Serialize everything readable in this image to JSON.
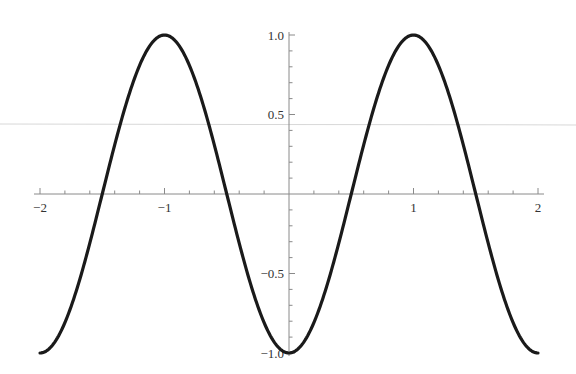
{
  "chart_data": {
    "type": "line",
    "title": "",
    "xlabel": "",
    "ylabel": "",
    "xlim": [
      -2,
      2
    ],
    "ylim": [
      -1,
      1
    ],
    "grid": false,
    "legend": null,
    "x_ticks": [
      -2,
      -1,
      1,
      2
    ],
    "x_tick_labels": [
      "−2",
      "−1",
      "1",
      "2"
    ],
    "x_minor_step": 0.2,
    "y_ticks": [
      1.0,
      0.5,
      -0.5,
      -1.0
    ],
    "y_tick_labels": [
      "1.0",
      "0.5",
      "−0.5",
      "−1.0"
    ],
    "y_minor_step": 0.1,
    "series": [
      {
        "name": "-cos(πx)",
        "color": "#1a1a1a",
        "x": [
          -2,
          -1.75,
          -1.5,
          -1.25,
          -1,
          -0.75,
          -0.5,
          -0.25,
          0,
          0.25,
          0.5,
          0.75,
          1,
          1.25,
          1.5,
          1.75,
          2
        ],
        "values": [
          -1,
          -0.707,
          0,
          0.707,
          1,
          0.707,
          0,
          -0.707,
          -1,
          -0.707,
          0,
          0.707,
          1,
          0.707,
          0,
          -0.707,
          -1
        ]
      }
    ]
  },
  "colors": {
    "curve": "#1a1a1a",
    "axis": "#8a8a8a",
    "labels": "#333333",
    "artifact_line": "#d8d8d8"
  }
}
